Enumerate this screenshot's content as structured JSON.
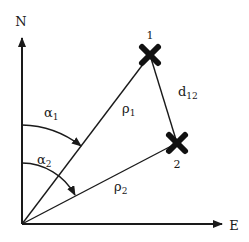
{
  "diagram": {
    "title": "",
    "axes": {
      "north": {
        "label": "N"
      },
      "east": {
        "label": "E"
      }
    },
    "points": [
      {
        "id": "1",
        "label": "1",
        "marker": "x-cross-icon"
      },
      {
        "id": "2",
        "label": "2",
        "marker": "x-cross-icon"
      }
    ],
    "ranges": [
      {
        "label_base": "ρ",
        "label_sub": "1"
      },
      {
        "label_base": "ρ",
        "label_sub": "2"
      }
    ],
    "angles": [
      {
        "label_base": "α",
        "label_sub": "1"
      },
      {
        "label_base": "α",
        "label_sub": "2"
      }
    ],
    "distance": {
      "label_base": "d",
      "label_sub": "12"
    },
    "colors": {
      "ink": "#1a1a1a",
      "background": "#ffffff"
    }
  }
}
